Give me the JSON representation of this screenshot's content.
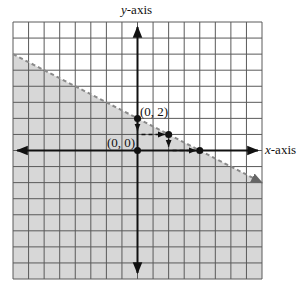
{
  "chart_data": {
    "type": "line",
    "title": "",
    "xlabel": "x-axis",
    "ylabel": "y-axis",
    "xlim": [
      -8,
      8
    ],
    "ylim": [
      -8,
      8
    ],
    "grid": true,
    "grid_step": 1,
    "boundary_line": {
      "equation": "y = 2 - x/2",
      "slope": -0.5,
      "intercept": 2,
      "style": "dashed",
      "from": [
        -8,
        6
      ],
      "to": [
        8,
        -2
      ],
      "arrow_end": true
    },
    "shaded_region": {
      "description": "half-plane below the dashed line",
      "inequality": "y < 2 - x/2"
    },
    "points": [
      {
        "x": 0,
        "y": 2,
        "label": "(0, 2)"
      },
      {
        "x": 0,
        "y": 0,
        "label": "(0, 0)"
      },
      {
        "x": 2,
        "y": 1,
        "label": ""
      },
      {
        "x": 4,
        "y": 0,
        "label": ""
      }
    ],
    "slope_steps": [
      {
        "from": [
          0,
          2
        ],
        "to": [
          0,
          1
        ],
        "style": "dashed",
        "arrow": true
      },
      {
        "from": [
          0,
          1
        ],
        "to": [
          2,
          1
        ],
        "style": "dashed",
        "arrow": true
      },
      {
        "from": [
          2,
          1
        ],
        "to": [
          2,
          0
        ],
        "style": "dashed",
        "arrow": true
      },
      {
        "from": [
          2,
          0
        ],
        "to": [
          4,
          0
        ],
        "style": "dashed",
        "arrow": true
      }
    ]
  },
  "labels": {
    "y_axis_prefix": "y",
    "y_axis_suffix": "-axis",
    "x_axis_prefix": "x",
    "x_axis_suffix": "-axis",
    "point_a": "(0, 2)",
    "point_b": "(0, 0)"
  },
  "colors": {
    "shade": "#d7d7d7",
    "grid": "#5a5a5a",
    "axis": "#111111",
    "boundary": "#8a8a8a",
    "point": "#111111"
  },
  "layout": {
    "left": 13,
    "top": 22,
    "right": 262,
    "bottom": 279
  }
}
